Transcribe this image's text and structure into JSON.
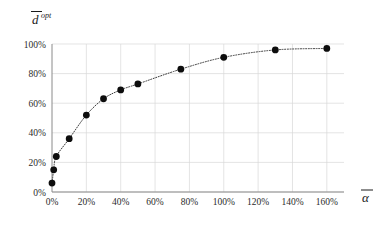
{
  "chart_data": {
    "type": "line",
    "title": "",
    "xlabel": "ᾱ",
    "ylabel": "d̄ opt",
    "ylabel_base": "d",
    "ylabel_sup": "opt",
    "xlabel_base": "α",
    "x": [
      0,
      1,
      2.5,
      10,
      20,
      30,
      40,
      50,
      75,
      100,
      130,
      160
    ],
    "values": [
      6,
      15,
      24,
      36,
      52,
      63,
      69,
      73,
      83,
      91,
      96,
      97
    ],
    "x_unit": "%",
    "y_unit": "%",
    "xlim": [
      0,
      170
    ],
    "ylim": [
      0,
      100
    ],
    "xticks": [
      0,
      20,
      40,
      60,
      80,
      100,
      120,
      140,
      160
    ],
    "yticks": [
      0,
      20,
      40,
      60,
      80,
      100
    ],
    "xticklabels": [
      "0%",
      "20%",
      "40%",
      "60%",
      "80%",
      "100%",
      "120%",
      "140%",
      "160%"
    ],
    "yticklabels": [
      "0%",
      "20%",
      "40%",
      "60%",
      "80%",
      "100%"
    ],
    "grid": true,
    "legend": null,
    "marker": "filled-circle",
    "linestyle": "dotted",
    "colors": {
      "marker": "#0d0d0d",
      "line": "#3a3a3a",
      "grid": "#d9d9d9",
      "axis": "#8a8a8a",
      "text": "#1a1a1a",
      "background": "#ffffff"
    }
  }
}
